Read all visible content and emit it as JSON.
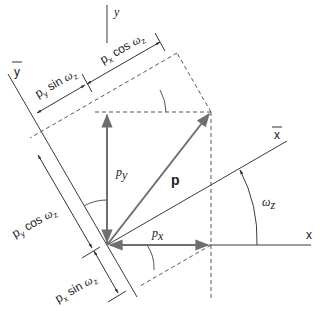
{
  "diagram": {
    "colors": {
      "line": "#3a3a3a",
      "vector": "#6e6e6e",
      "dashed": "#555555"
    },
    "labels": {
      "y_axis": "y",
      "x_axis": "x",
      "y_bar": "y",
      "x_bar": "x",
      "vector_p": "p",
      "p_y": "p",
      "p_y_sub": "y",
      "p_x": "p",
      "p_x_sub": "x",
      "omega": "ω",
      "omega_sub": "z",
      "dim_px_cos": "p",
      "dim_px_cos_sub": "x",
      "dim_px_cos_rest": " cos ",
      "dim_py_sin": "p",
      "dim_py_sin_sub": "y",
      "dim_py_sin_rest": " sin ",
      "dim_py_cos": "p",
      "dim_py_cos_sub": "y",
      "dim_py_cos_rest": " cos ",
      "dim_px_sin": "p",
      "dim_px_sin_sub": "x",
      "dim_px_sin_rest": " sin "
    }
  }
}
